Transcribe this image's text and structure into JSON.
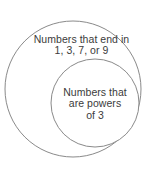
{
  "diagram": {
    "type": "euler-diagram",
    "background_color": "#ffffff",
    "stroke_color": "#8a8a8a",
    "text_color": "#3b3b3b",
    "outer_set": {
      "name": "numbers-ending-in-1-3-7-9",
      "label_lines": [
        "Numbers that end in",
        "1, 3, 7, or 9"
      ],
      "label_full": "Numbers that end in 1, 3, 7, or 9",
      "circle": {
        "cx": 73,
        "cy": 89,
        "r": 68
      }
    },
    "inner_set": {
      "name": "powers-of-3",
      "label_lines": [
        "Numbers that",
        "are powers",
        "of 3"
      ],
      "label_full": "Numbers that are powers of 3",
      "circle": {
        "cx": 95,
        "cy": 103,
        "r": 44
      }
    }
  }
}
